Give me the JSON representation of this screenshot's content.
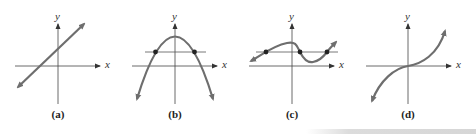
{
  "figure": {
    "axis_labels": {
      "x": "x",
      "y": "y"
    },
    "colors": {
      "axis": "#333333",
      "curve": "#6e6e6e",
      "point": "#222222"
    },
    "panels": [
      {
        "id": "a",
        "caption": "(a)",
        "description": "straight line with positive slope"
      },
      {
        "id": "b",
        "caption": "(b)",
        "description": "downward-opening parabola crossed by a horizontal line at two points"
      },
      {
        "id": "c",
        "caption": "(c)",
        "description": "cubic-like curve crossed by a horizontal line at three points"
      },
      {
        "id": "d",
        "caption": "(d)",
        "description": "increasing cubic curve through the origin"
      }
    ]
  }
}
